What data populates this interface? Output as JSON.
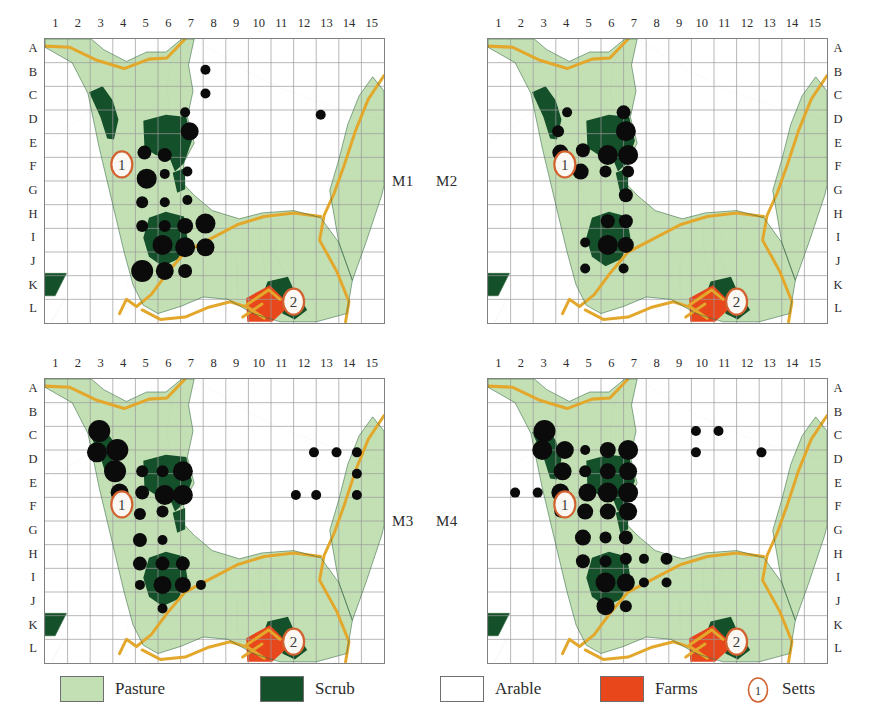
{
  "figure": {
    "type": "map-grid-matrix",
    "panel_count": 4,
    "column_labels": [
      "1",
      "2",
      "3",
      "4",
      "5",
      "6",
      "7",
      "8",
      "9",
      "10",
      "11",
      "12",
      "13",
      "14",
      "15"
    ],
    "row_labels": [
      "A",
      "B",
      "C",
      "D",
      "E",
      "F",
      "G",
      "H",
      "I",
      "J",
      "K",
      "L"
    ]
  },
  "colors": {
    "pasture": "#c3e0b4",
    "scrub": "#14502a",
    "arable": "#ffffff",
    "farms": "#e8471c",
    "sett_outline": "#d2622f",
    "sett_fill": "#fbf7f2",
    "road": "#e2a72b",
    "boundary": "#4a4a4a",
    "grid": "#9a9a9a",
    "frame": "#808080",
    "dot": "#0b0b0b"
  },
  "legend": {
    "items": [
      {
        "key": "pasture",
        "label": "Pasture",
        "swatch": "pasture",
        "icon": "color-swatch"
      },
      {
        "key": "scrub",
        "label": "Scrub",
        "swatch": "scrub",
        "icon": "color-swatch"
      },
      {
        "key": "arable",
        "label": "Arable",
        "swatch": "arable",
        "icon": "color-swatch"
      },
      {
        "key": "farms",
        "label": "Farms",
        "swatch": "farms",
        "icon": "color-swatch"
      },
      {
        "key": "setts",
        "label": "Setts",
        "swatch": "sett",
        "icon": "sett-marker-icon",
        "marker_number": "1"
      }
    ]
  },
  "panels": [
    {
      "id": "M1",
      "label": "M1",
      "label_side": "right",
      "row_label_side": "left",
      "setts": [
        {
          "number": "1",
          "col": 3.4,
          "row": 5.3
        },
        {
          "number": "2",
          "col": 11.0,
          "row": 11.1
        }
      ],
      "dots": [
        {
          "col": 7.1,
          "row": 1.3,
          "r": 5
        },
        {
          "col": 7.1,
          "row": 2.3,
          "r": 5
        },
        {
          "col": 12.2,
          "row": 3.2,
          "r": 5
        },
        {
          "col": 6.2,
          "row": 3.1,
          "r": 5
        },
        {
          "col": 6.4,
          "row": 3.9,
          "r": 9
        },
        {
          "col": 4.4,
          "row": 4.8,
          "r": 7
        },
        {
          "col": 5.3,
          "row": 4.9,
          "r": 7
        },
        {
          "col": 4.5,
          "row": 5.9,
          "r": 10
        },
        {
          "col": 5.3,
          "row": 5.7,
          "r": 5
        },
        {
          "col": 6.3,
          "row": 5.6,
          "r": 5
        },
        {
          "col": 4.3,
          "row": 6.9,
          "r": 6
        },
        {
          "col": 5.3,
          "row": 6.9,
          "r": 5
        },
        {
          "col": 6.3,
          "row": 6.8,
          "r": 5
        },
        {
          "col": 4.3,
          "row": 7.9,
          "r": 6
        },
        {
          "col": 5.3,
          "row": 7.9,
          "r": 6
        },
        {
          "col": 6.2,
          "row": 7.9,
          "r": 8
        },
        {
          "col": 7.1,
          "row": 7.8,
          "r": 10
        },
        {
          "col": 5.2,
          "row": 8.7,
          "r": 10
        },
        {
          "col": 6.2,
          "row": 8.8,
          "r": 10
        },
        {
          "col": 7.1,
          "row": 8.8,
          "r": 9
        },
        {
          "col": 4.3,
          "row": 9.8,
          "r": 11
        },
        {
          "col": 5.3,
          "row": 9.8,
          "r": 9
        },
        {
          "col": 6.2,
          "row": 9.8,
          "r": 7
        }
      ]
    },
    {
      "id": "M2",
      "label": "M2",
      "label_side": "left",
      "row_label_side": "right",
      "setts": [
        {
          "number": "1",
          "col": 3.4,
          "row": 5.3
        },
        {
          "number": "2",
          "col": 11.0,
          "row": 11.1
        }
      ],
      "dots": [
        {
          "col": 3.5,
          "row": 3.1,
          "r": 5
        },
        {
          "col": 6.0,
          "row": 3.1,
          "r": 7
        },
        {
          "col": 3.1,
          "row": 3.9,
          "r": 6
        },
        {
          "col": 6.1,
          "row": 3.9,
          "r": 10
        },
        {
          "col": 3.2,
          "row": 4.8,
          "r": 8
        },
        {
          "col": 4.2,
          "row": 4.7,
          "r": 7
        },
        {
          "col": 5.3,
          "row": 4.9,
          "r": 10
        },
        {
          "col": 6.2,
          "row": 4.9,
          "r": 10
        },
        {
          "col": 4.1,
          "row": 5.6,
          "r": 8
        },
        {
          "col": 5.2,
          "row": 5.6,
          "r": 6
        },
        {
          "col": 6.2,
          "row": 5.6,
          "r": 6
        },
        {
          "col": 6.1,
          "row": 6.6,
          "r": 7
        },
        {
          "col": 5.3,
          "row": 7.7,
          "r": 7
        },
        {
          "col": 6.1,
          "row": 7.7,
          "r": 7
        },
        {
          "col": 4.3,
          "row": 8.6,
          "r": 5
        },
        {
          "col": 5.3,
          "row": 8.7,
          "r": 10
        },
        {
          "col": 6.1,
          "row": 8.7,
          "r": 8
        },
        {
          "col": 4.3,
          "row": 9.7,
          "r": 5
        },
        {
          "col": 6.0,
          "row": 9.7,
          "r": 5
        }
      ]
    },
    {
      "id": "M3",
      "label": "M3",
      "label_side": "right",
      "row_label_side": "left",
      "setts": [
        {
          "number": "1",
          "col": 3.4,
          "row": 5.3
        },
        {
          "number": "2",
          "col": 11.0,
          "row": 11.1
        }
      ],
      "dots": [
        {
          "col": 2.4,
          "row": 2.2,
          "r": 11
        },
        {
          "col": 2.3,
          "row": 3.1,
          "r": 10
        },
        {
          "col": 3.2,
          "row": 3.0,
          "r": 11
        },
        {
          "col": 3.1,
          "row": 3.9,
          "r": 11
        },
        {
          "col": 4.3,
          "row": 3.9,
          "r": 6
        },
        {
          "col": 5.2,
          "row": 3.9,
          "r": 6
        },
        {
          "col": 6.1,
          "row": 3.9,
          "r": 10
        },
        {
          "col": 3.3,
          "row": 4.8,
          "r": 9
        },
        {
          "col": 4.3,
          "row": 4.8,
          "r": 7
        },
        {
          "col": 5.3,
          "row": 4.9,
          "r": 10
        },
        {
          "col": 6.1,
          "row": 4.9,
          "r": 10
        },
        {
          "col": 4.2,
          "row": 5.7,
          "r": 6
        },
        {
          "col": 5.2,
          "row": 5.6,
          "r": 6
        },
        {
          "col": 4.2,
          "row": 6.8,
          "r": 7
        },
        {
          "col": 5.2,
          "row": 6.8,
          "r": 5
        },
        {
          "col": 4.2,
          "row": 7.8,
          "r": 7
        },
        {
          "col": 5.2,
          "row": 7.8,
          "r": 7
        },
        {
          "col": 6.1,
          "row": 7.8,
          "r": 7
        },
        {
          "col": 4.2,
          "row": 8.7,
          "r": 5
        },
        {
          "col": 5.2,
          "row": 8.7,
          "r": 9
        },
        {
          "col": 6.1,
          "row": 8.7,
          "r": 8
        },
        {
          "col": 6.9,
          "row": 8.7,
          "r": 5
        },
        {
          "col": 5.2,
          "row": 9.7,
          "r": 5
        },
        {
          "col": 11.9,
          "row": 3.1,
          "r": 5
        },
        {
          "col": 12.9,
          "row": 3.1,
          "r": 5
        },
        {
          "col": 13.8,
          "row": 3.1,
          "r": 5
        },
        {
          "col": 13.8,
          "row": 4.0,
          "r": 5
        },
        {
          "col": 11.1,
          "row": 4.9,
          "r": 5
        },
        {
          "col": 12.0,
          "row": 4.9,
          "r": 5
        },
        {
          "col": 13.8,
          "row": 4.9,
          "r": 5
        }
      ]
    },
    {
      "id": "M4",
      "label": "M4",
      "label_side": "left",
      "row_label_side": "right",
      "setts": [
        {
          "number": "1",
          "col": 3.4,
          "row": 5.3
        },
        {
          "number": "2",
          "col": 11.0,
          "row": 11.1
        }
      ],
      "dots": [
        {
          "col": 2.5,
          "row": 2.2,
          "r": 11
        },
        {
          "col": 2.4,
          "row": 3.0,
          "r": 10
        },
        {
          "col": 3.4,
          "row": 3.0,
          "r": 9
        },
        {
          "col": 4.3,
          "row": 3.0,
          "r": 5
        },
        {
          "col": 5.3,
          "row": 3.0,
          "r": 8
        },
        {
          "col": 6.2,
          "row": 3.0,
          "r": 10
        },
        {
          "col": 3.3,
          "row": 3.9,
          "r": 9
        },
        {
          "col": 4.3,
          "row": 3.9,
          "r": 6
        },
        {
          "col": 5.3,
          "row": 3.9,
          "r": 8
        },
        {
          "col": 6.2,
          "row": 3.9,
          "r": 9
        },
        {
          "col": 1.2,
          "row": 4.8,
          "r": 5
        },
        {
          "col": 2.2,
          "row": 4.8,
          "r": 5
        },
        {
          "col": 3.2,
          "row": 4.8,
          "r": 9
        },
        {
          "col": 4.4,
          "row": 4.8,
          "r": 9
        },
        {
          "col": 5.3,
          "row": 4.8,
          "r": 10
        },
        {
          "col": 6.2,
          "row": 4.8,
          "r": 10
        },
        {
          "col": 3.2,
          "row": 5.6,
          "r": 6
        },
        {
          "col": 4.3,
          "row": 5.6,
          "r": 8
        },
        {
          "col": 5.3,
          "row": 5.6,
          "r": 8
        },
        {
          "col": 6.2,
          "row": 5.6,
          "r": 9
        },
        {
          "col": 4.2,
          "row": 6.7,
          "r": 8
        },
        {
          "col": 5.2,
          "row": 6.7,
          "r": 6
        },
        {
          "col": 6.1,
          "row": 6.7,
          "r": 7
        },
        {
          "col": 4.2,
          "row": 7.7,
          "r": 7
        },
        {
          "col": 5.2,
          "row": 7.7,
          "r": 6
        },
        {
          "col": 6.1,
          "row": 7.6,
          "r": 6
        },
        {
          "col": 6.9,
          "row": 7.6,
          "r": 5
        },
        {
          "col": 7.9,
          "row": 7.6,
          "r": 6
        },
        {
          "col": 5.2,
          "row": 8.6,
          "r": 10
        },
        {
          "col": 6.1,
          "row": 8.6,
          "r": 9
        },
        {
          "col": 6.9,
          "row": 8.6,
          "r": 5
        },
        {
          "col": 7.9,
          "row": 8.6,
          "r": 5
        },
        {
          "col": 5.2,
          "row": 9.6,
          "r": 9
        },
        {
          "col": 6.1,
          "row": 9.6,
          "r": 6
        },
        {
          "col": 9.2,
          "row": 2.2,
          "r": 5
        },
        {
          "col": 10.2,
          "row": 2.2,
          "r": 5
        },
        {
          "col": 9.2,
          "row": 3.1,
          "r": 5
        },
        {
          "col": 12.1,
          "row": 3.1,
          "r": 5
        }
      ]
    }
  ]
}
